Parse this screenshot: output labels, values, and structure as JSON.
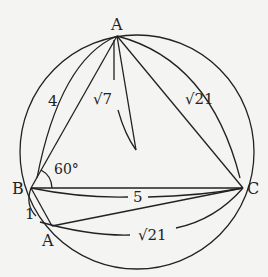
{
  "diagram": {
    "type": "geometry-inscribed-triangle",
    "points": {
      "A_top": {
        "label": "A",
        "x": 117,
        "y": 36
      },
      "B": {
        "label": "B",
        "x": 31,
        "y": 188
      },
      "C": {
        "label": "C",
        "x": 243,
        "y": 188
      },
      "A_bottom": {
        "label": "A",
        "x": 52,
        "y": 226
      },
      "foot": {
        "x": 136,
        "y": 150
      }
    },
    "circle": {
      "cx": 137,
      "cy": 152,
      "r": 117
    },
    "labels": {
      "AB": "4",
      "AD": "√7",
      "AC": "√21",
      "BC": "5",
      "BA2": "1",
      "A2C": "√21",
      "angle_B": "60°"
    },
    "stroke_color": "#222222",
    "background": "#f4f4f2"
  }
}
